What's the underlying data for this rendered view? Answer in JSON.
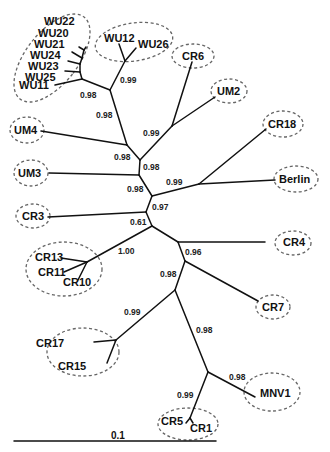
{
  "diagram": {
    "type": "unrooted phylogenetic tree",
    "tips": [
      {
        "id": "WU22",
        "label": "WU22",
        "x": 44,
        "y": 25
      },
      {
        "id": "WU20",
        "label": "WU20",
        "x": 38,
        "y": 37
      },
      {
        "id": "WU21",
        "label": "WU21",
        "x": 34,
        "y": 48
      },
      {
        "id": "WU24",
        "label": "WU24",
        "x": 30,
        "y": 59
      },
      {
        "id": "WU23",
        "label": "WU23",
        "x": 28,
        "y": 70
      },
      {
        "id": "WU25",
        "label": "WU25",
        "x": 25,
        "y": 81
      },
      {
        "id": "WU11",
        "label": "WU11",
        "x": 19,
        "y": 89
      },
      {
        "id": "WU12",
        "label": "WU12",
        "x": 104,
        "y": 42
      },
      {
        "id": "WU26",
        "label": "WU26",
        "x": 138,
        "y": 48
      },
      {
        "id": "CR6",
        "label": "CR6",
        "x": 180,
        "y": 59
      },
      {
        "id": "UM2",
        "label": "UM2",
        "x": 217,
        "y": 94
      },
      {
        "id": "CR18",
        "label": "CR18",
        "x": 268,
        "y": 127
      },
      {
        "id": "UM4",
        "label": "UM4",
        "x": 14,
        "y": 132
      },
      {
        "id": "UM3",
        "label": "UM3",
        "x": 18,
        "y": 177
      },
      {
        "id": "Berlin",
        "label": "Berlin",
        "x": 280,
        "y": 183
      },
      {
        "id": "CR3",
        "label": "CR3",
        "x": 22,
        "y": 219
      },
      {
        "id": "CR13",
        "label": "CR13",
        "x": 35,
        "y": 261
      },
      {
        "id": "CR11",
        "label": "CR11",
        "x": 38,
        "y": 275
      },
      {
        "id": "CR10",
        "label": "CR10",
        "x": 63,
        "y": 285
      },
      {
        "id": "CR4",
        "label": "CR4",
        "x": 284,
        "y": 246
      },
      {
        "id": "CR7",
        "label": "CR7",
        "x": 262,
        "y": 310
      },
      {
        "id": "CR17",
        "label": "CR17",
        "x": 36,
        "y": 347
      },
      {
        "id": "CR15",
        "label": "CR15",
        "x": 58,
        "y": 370
      },
      {
        "id": "MNV1",
        "label": "MNV1",
        "x": 260,
        "y": 397
      },
      {
        "id": "CR5",
        "label": "CR5",
        "x": 161,
        "y": 425
      },
      {
        "id": "CR1",
        "label": "CR1",
        "x": 190,
        "y": 431
      }
    ],
    "support_values": [
      {
        "value": "0.99",
        "x": 120,
        "y": 82
      },
      {
        "value": "0.98",
        "x": 80,
        "y": 97
      },
      {
        "value": "0.98",
        "x": 96,
        "y": 117
      },
      {
        "value": "0.99",
        "x": 143,
        "y": 136
      },
      {
        "value": "0.98",
        "x": 114,
        "y": 159
      },
      {
        "value": "0.98",
        "x": 143,
        "y": 170
      },
      {
        "value": "0.98",
        "x": 127,
        "y": 192
      },
      {
        "value": "0.99",
        "x": 166,
        "y": 185
      },
      {
        "value": "0.97",
        "x": 152,
        "y": 210
      },
      {
        "value": "0.61",
        "x": 129,
        "y": 224
      },
      {
        "value": "1.00",
        "x": 118,
        "y": 254
      },
      {
        "value": "0.96",
        "x": 185,
        "y": 255
      },
      {
        "value": "0.98",
        "x": 160,
        "y": 277
      },
      {
        "value": "0.99",
        "x": 124,
        "y": 315
      },
      {
        "value": "0.98",
        "x": 196,
        "y": 333
      },
      {
        "value": "0.98",
        "x": 229,
        "y": 379
      },
      {
        "value": "0.99",
        "x": 177,
        "y": 398
      }
    ],
    "scale_bar": {
      "label": "0.1",
      "x1": 14,
      "x2": 216,
      "y": 440
    }
  }
}
